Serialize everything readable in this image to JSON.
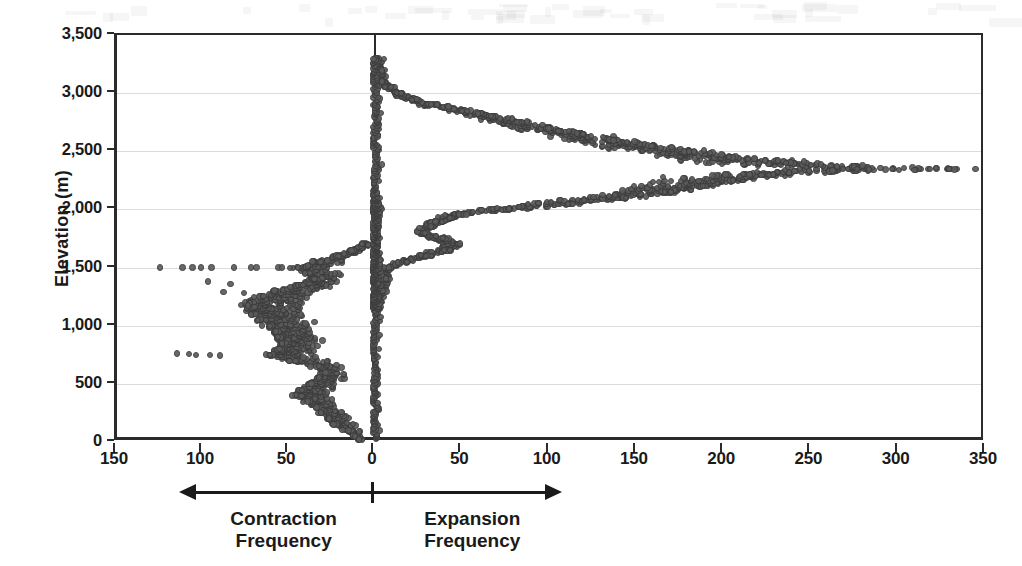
{
  "chart_data": {
    "type": "scatter",
    "title": "",
    "subtitle": "",
    "xlabel": "",
    "ylabel": "Elevation (m)",
    "ylim": [
      0,
      3500
    ],
    "y_ticks": [
      0,
      500,
      1000,
      1500,
      2000,
      2500,
      3000,
      3500
    ],
    "y_tick_labels": [
      "0",
      "500",
      "1,000",
      "1,500",
      "2,000",
      "2,500",
      "3,000",
      "3,500"
    ],
    "x_axis_note": "Diverging axis: left branch counts Contraction Frequency (150 at far left decreasing to 0 at center); right branch counts Expansion Frequency (0 at center increasing to 350 at far right).",
    "x_ticks_left": [
      150,
      100,
      50,
      0
    ],
    "x_ticks_right": [
      50,
      100,
      150,
      200,
      250,
      300,
      350
    ],
    "x_tick_labels": [
      "150",
      "100",
      "50",
      "0",
      "50",
      "100",
      "150",
      "200",
      "250",
      "300",
      "350"
    ],
    "xlim_left": 150,
    "xlim_right": 350,
    "grid": "horizontal gridlines at every 500 m",
    "legend": "none",
    "marker": "small open circle, dark gray",
    "annotations": [
      {
        "name": "contraction",
        "text_line1": "Contraction",
        "text_line2": "Frequency",
        "direction": "left"
      },
      {
        "name": "expansion",
        "text_line1": "Expansion",
        "text_line2": "Frequency",
        "direction": "right"
      }
    ],
    "series": [
      {
        "name": "Expansion Frequency",
        "side": "right",
        "description": "Values rise from near 0 at 3,300 m to a broad maximum of about 345 near 2,350 m, then fall back toward 0 by 1,700 m; a secondary low lobe spans 1,150-2,000 m reaching about 55.",
        "profile": [
          {
            "elevation": 3300,
            "frequency": 2
          },
          {
            "elevation": 3200,
            "frequency": 3
          },
          {
            "elevation": 3100,
            "frequency": 5
          },
          {
            "elevation": 3050,
            "frequency": 8
          },
          {
            "elevation": 3000,
            "frequency": 14
          },
          {
            "elevation": 2950,
            "frequency": 22
          },
          {
            "elevation": 2900,
            "frequency": 34
          },
          {
            "elevation": 2850,
            "frequency": 52
          },
          {
            "elevation": 2800,
            "frequency": 68
          },
          {
            "elevation": 2750,
            "frequency": 84
          },
          {
            "elevation": 2700,
            "frequency": 100
          },
          {
            "elevation": 2650,
            "frequency": 118
          },
          {
            "elevation": 2600,
            "frequency": 136
          },
          {
            "elevation": 2550,
            "frequency": 158
          },
          {
            "elevation": 2500,
            "frequency": 180
          },
          {
            "elevation": 2450,
            "frequency": 205
          },
          {
            "elevation": 2400,
            "frequency": 238
          },
          {
            "elevation": 2370,
            "frequency": 275
          },
          {
            "elevation": 2350,
            "frequency": 330
          },
          {
            "elevation": 2330,
            "frequency": 262
          },
          {
            "elevation": 2300,
            "frequency": 228
          },
          {
            "elevation": 2250,
            "frequency": 205
          },
          {
            "elevation": 2200,
            "frequency": 188
          },
          {
            "elevation": 2150,
            "frequency": 168
          },
          {
            "elevation": 2100,
            "frequency": 142
          },
          {
            "elevation": 2050,
            "frequency": 112
          },
          {
            "elevation": 2000,
            "frequency": 76
          },
          {
            "elevation": 1960,
            "frequency": 50
          },
          {
            "elevation": 1930,
            "frequency": 44
          },
          {
            "elevation": 1900,
            "frequency": 38
          },
          {
            "elevation": 1850,
            "frequency": 32
          },
          {
            "elevation": 1800,
            "frequency": 28
          },
          {
            "elevation": 1750,
            "frequency": 40
          },
          {
            "elevation": 1700,
            "frequency": 48
          },
          {
            "elevation": 1650,
            "frequency": 42
          },
          {
            "elevation": 1600,
            "frequency": 30
          },
          {
            "elevation": 1550,
            "frequency": 18
          },
          {
            "elevation": 1500,
            "frequency": 8
          },
          {
            "elevation": 1400,
            "frequency": 6
          },
          {
            "elevation": 1300,
            "frequency": 5
          },
          {
            "elevation": 1200,
            "frequency": 3
          },
          {
            "elevation": 1150,
            "frequency": 2
          }
        ],
        "outliers_right_tail": [
          {
            "elevation": 2350,
            "frequency": 268
          },
          {
            "elevation": 2350,
            "frequency": 276
          },
          {
            "elevation": 2345,
            "frequency": 283
          },
          {
            "elevation": 2350,
            "frequency": 296
          },
          {
            "elevation": 2340,
            "frequency": 309
          },
          {
            "elevation": 2350,
            "frequency": 318
          },
          {
            "elevation": 2345,
            "frequency": 332
          },
          {
            "elevation": 2350,
            "frequency": 344
          }
        ]
      },
      {
        "name": "Contraction Frequency",
        "side": "left",
        "description": "Main mass spans 0-1,700 m with values typically 10-70; strongest near 700-1,300 m reaching about 80, with a scattered tail of isolated points to 125 along the 1,500 m and 750 m lines.",
        "profile": [
          {
            "elevation": 1700,
            "frequency": 6
          },
          {
            "elevation": 1650,
            "frequency": 14
          },
          {
            "elevation": 1600,
            "frequency": 22
          },
          {
            "elevation": 1550,
            "frequency": 34
          },
          {
            "elevation": 1500,
            "frequency": 46
          },
          {
            "elevation": 1450,
            "frequency": 40
          },
          {
            "elevation": 1400,
            "frequency": 36
          },
          {
            "elevation": 1350,
            "frequency": 44
          },
          {
            "elevation": 1300,
            "frequency": 58
          },
          {
            "elevation": 1250,
            "frequency": 66
          },
          {
            "elevation": 1200,
            "frequency": 72
          },
          {
            "elevation": 1150,
            "frequency": 74
          },
          {
            "elevation": 1100,
            "frequency": 70
          },
          {
            "elevation": 1050,
            "frequency": 66
          },
          {
            "elevation": 1000,
            "frequency": 62
          },
          {
            "elevation": 950,
            "frequency": 58
          },
          {
            "elevation": 900,
            "frequency": 56
          },
          {
            "elevation": 850,
            "frequency": 54
          },
          {
            "elevation": 800,
            "frequency": 56
          },
          {
            "elevation": 750,
            "frequency": 62
          },
          {
            "elevation": 700,
            "frequency": 48
          },
          {
            "elevation": 650,
            "frequency": 34
          },
          {
            "elevation": 600,
            "frequency": 30
          },
          {
            "elevation": 550,
            "frequency": 32
          },
          {
            "elevation": 500,
            "frequency": 38
          },
          {
            "elevation": 450,
            "frequency": 42
          },
          {
            "elevation": 400,
            "frequency": 46
          },
          {
            "elevation": 350,
            "frequency": 40
          },
          {
            "elevation": 300,
            "frequency": 34
          },
          {
            "elevation": 250,
            "frequency": 30
          },
          {
            "elevation": 200,
            "frequency": 26
          },
          {
            "elevation": 150,
            "frequency": 22
          },
          {
            "elevation": 100,
            "frequency": 16
          },
          {
            "elevation": 50,
            "frequency": 12
          },
          {
            "elevation": 20,
            "frequency": 8
          },
          {
            "elevation": 0,
            "frequency": 5
          }
        ],
        "outliers_left_tail": [
          {
            "elevation": 1500,
            "frequency": 125
          },
          {
            "elevation": 1500,
            "frequency": 112
          },
          {
            "elevation": 1500,
            "frequency": 106
          },
          {
            "elevation": 1500,
            "frequency": 101
          },
          {
            "elevation": 1500,
            "frequency": 95
          },
          {
            "elevation": 1500,
            "frequency": 82
          },
          {
            "elevation": 1500,
            "frequency": 72
          },
          {
            "elevation": 1500,
            "frequency": 69
          },
          {
            "elevation": 1500,
            "frequency": 56
          },
          {
            "elevation": 1500,
            "frequency": 54
          },
          {
            "elevation": 1380,
            "frequency": 97
          },
          {
            "elevation": 1360,
            "frequency": 84
          },
          {
            "elevation": 1290,
            "frequency": 88
          },
          {
            "elevation": 1280,
            "frequency": 76
          },
          {
            "elevation": 1180,
            "frequency": 78
          },
          {
            "elevation": 1175,
            "frequency": 74
          },
          {
            "elevation": 1160,
            "frequency": 70
          },
          {
            "elevation": 760,
            "frequency": 115
          },
          {
            "elevation": 755,
            "frequency": 108
          },
          {
            "elevation": 750,
            "frequency": 104
          },
          {
            "elevation": 750,
            "frequency": 96
          },
          {
            "elevation": 745,
            "frequency": 90
          }
        ]
      }
    ]
  },
  "axes": {
    "y_title": "Elevation (m)",
    "y_tick_labels": [
      "3,500",
      "3,000",
      "2,500",
      "2,000",
      "1,500",
      "1,000",
      "500",
      "0"
    ],
    "x_tick_labels": [
      "150",
      "100",
      "50",
      "0",
      "50",
      "100",
      "150",
      "200",
      "250",
      "300",
      "350"
    ]
  },
  "annotations": {
    "contraction": {
      "line1": "Contraction",
      "line2": "Frequency"
    },
    "expansion": {
      "line1": "Expansion",
      "line2": "Frequency"
    }
  },
  "colors": {
    "marker_fill": "#5b5b5b",
    "marker_stroke": "#3c3c3c",
    "axis": "#2b2b2b",
    "gridline": "#dcdcdc",
    "background": "#ffffff",
    "text": "#1a1a1a"
  }
}
